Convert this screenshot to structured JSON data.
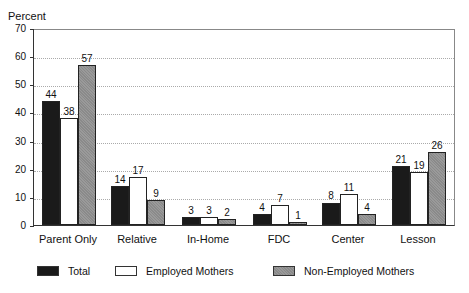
{
  "chart_data": {
    "type": "bar",
    "title": "",
    "ylabel": "Percent",
    "xlabel": "",
    "ylim": [
      0,
      70
    ],
    "yticks": [
      0,
      10,
      20,
      30,
      40,
      50,
      60,
      70
    ],
    "grid": true,
    "legend_position": "bottom",
    "categories": [
      "Parent Only",
      "Relative",
      "In-Home",
      "FDC",
      "Center",
      "Lesson"
    ],
    "series": [
      {
        "name": "Total",
        "color": "#1a1a1a",
        "values": [
          44,
          14,
          3,
          4,
          8,
          21
        ]
      },
      {
        "name": "Employed Mothers",
        "color": "#ffffff",
        "values": [
          38,
          17,
          3,
          7,
          11,
          19
        ]
      },
      {
        "name": "Non-Employed Mothers",
        "color": "#929292",
        "values": [
          57,
          9,
          2,
          1,
          4,
          26
        ]
      }
    ]
  },
  "axis": {
    "title": "Percent",
    "ticks": [
      "0",
      "10",
      "20",
      "30",
      "40",
      "50",
      "60",
      "70"
    ]
  },
  "legend": {
    "items": [
      "Total",
      "Employed Mothers",
      "Non-Employed Mothers"
    ]
  }
}
